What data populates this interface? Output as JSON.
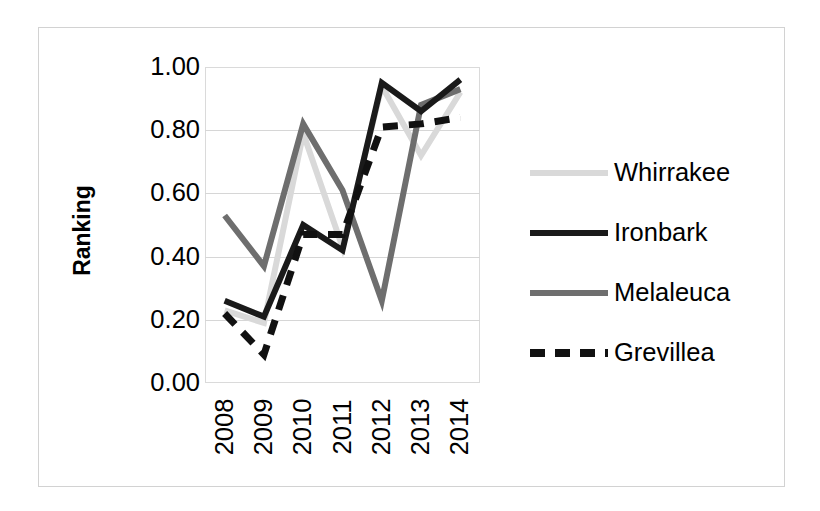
{
  "chart_data": {
    "type": "line",
    "title": "",
    "xlabel": "",
    "ylabel": "Ranking",
    "categories": [
      "2008",
      "2009",
      "2010",
      "2011",
      "2012",
      "2013",
      "2014"
    ],
    "ylim": [
      0.0,
      1.0
    ],
    "ytick_labels": [
      "1.00",
      "0.80",
      "0.60",
      "0.40",
      "0.20",
      "0.00"
    ],
    "ytick_values": [
      1.0,
      0.8,
      0.6,
      0.4,
      0.2,
      0.0
    ],
    "grid": true,
    "legend_position": "right",
    "series": [
      {
        "name": "Whirrakee",
        "color": "#d9d9d9",
        "style": "solid",
        "values": [
          0.23,
          0.19,
          0.79,
          0.43,
          0.94,
          0.72,
          0.92
        ]
      },
      {
        "name": "Ironbark",
        "color": "#1a1a1a",
        "style": "solid",
        "values": [
          0.26,
          0.21,
          0.5,
          0.42,
          0.95,
          0.86,
          0.96
        ]
      },
      {
        "name": "Melaleuca",
        "color": "#6e6e6e",
        "style": "solid",
        "values": [
          0.53,
          0.37,
          0.82,
          0.61,
          0.26,
          0.88,
          0.93
        ]
      },
      {
        "name": "Grevillea",
        "color": "#111111",
        "style": "dashed",
        "values": [
          0.22,
          0.09,
          0.47,
          0.47,
          0.81,
          0.82,
          0.84
        ]
      }
    ]
  },
  "legend": {
    "entries": [
      {
        "label": "Whirrakee",
        "swatch": "legend-line-light-gray-solid"
      },
      {
        "label": "Ironbark",
        "swatch": "legend-line-black-solid"
      },
      {
        "label": "Melaleuca",
        "swatch": "legend-line-gray-solid"
      },
      {
        "label": "Grevillea",
        "swatch": "legend-line-black-dashed"
      }
    ]
  }
}
